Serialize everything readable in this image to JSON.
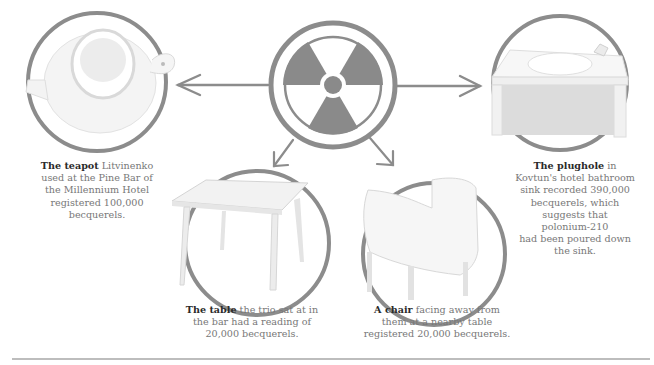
{
  "center": {
    "symbol": "radiation-trefoil"
  },
  "items": [
    {
      "id": "teapot",
      "title": "The teapot",
      "lines": [
        "Litvinenko",
        "used at the Pine Bar of",
        "the Millennium Hotel",
        "registered 100,000",
        "becquerels."
      ]
    },
    {
      "id": "table",
      "title": "The table",
      "lines": [
        "the trio sat at in",
        "the bar had a reading of",
        "20,000 becquerels."
      ]
    },
    {
      "id": "chair",
      "title": "A chair",
      "lines": [
        "facing away from",
        "them at a nearby table",
        "registered 20,000 becquerels."
      ]
    },
    {
      "id": "plughole",
      "title": "The plughole",
      "lines": [
        "in",
        "Kovtun's hotel bathroom",
        "sink recorded 390,000",
        "becquerels, which",
        "suggests that",
        "polonium-210",
        "had been poured down",
        "the sink."
      ]
    }
  ],
  "colors": {
    "ring": "#8c8c8c",
    "trefoil": "#8a8a8a",
    "caption_bold": "#2a2a2a",
    "caption_text": "#777777",
    "rule": "#bdbdbd"
  }
}
